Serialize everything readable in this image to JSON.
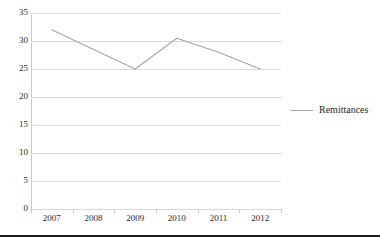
{
  "chart_data": {
    "type": "line",
    "title": "",
    "xlabel": "",
    "ylabel": "",
    "categories": [
      "2007",
      "2008",
      "2009",
      "2010",
      "2011",
      "2012"
    ],
    "series": [
      {
        "name": "Remittances",
        "color": "#a6a6a6",
        "values": [
          32,
          28.5,
          25,
          30.5,
          28,
          25
        ]
      }
    ],
    "ylim": [
      0,
      35
    ],
    "ytick_step": 5,
    "yticks": [
      35,
      30,
      25,
      20,
      15,
      10,
      5,
      0
    ],
    "grid": true,
    "grid_color": "#d9d9d9",
    "legend_position": "right",
    "markers": false
  },
  "legend": {
    "entries": [
      {
        "label": "Remittances",
        "color": "#a6a6a6"
      }
    ]
  },
  "axes": {
    "y_tick_labels": [
      "35",
      "30",
      "25",
      "20",
      "15",
      "10",
      "5",
      "0"
    ],
    "x_tick_labels": [
      "2007",
      "2008",
      "2009",
      "2010",
      "2011",
      "2012"
    ]
  }
}
